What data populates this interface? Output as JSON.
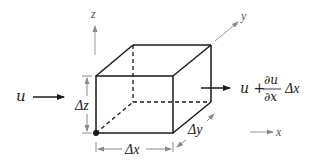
{
  "diagram": {
    "type": "fluid-element-control-volume",
    "axes": {
      "z": {
        "label": "z"
      },
      "y": {
        "label": "y"
      },
      "x": {
        "label": "x"
      }
    },
    "inflow": {
      "label": "u"
    },
    "outflow": {
      "label_prefix": "u +",
      "numerator": "∂u",
      "denominator": "∂x",
      "suffix": "Δx"
    },
    "dimensions": {
      "dx": "Δx",
      "dy": "Δy",
      "dz": "Δz"
    },
    "colors": {
      "edge": "#1a1a1a",
      "axis": "#8a8a8a",
      "dimension": "#8a8a8a",
      "text": "#222222"
    }
  }
}
